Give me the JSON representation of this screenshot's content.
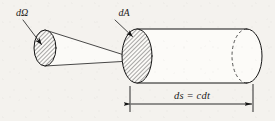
{
  "figure": {
    "kind": "physics-diagram",
    "background_color": "#f4f2ee",
    "ink_color": "#141414",
    "labels": {
      "solid_angle": "dΩ",
      "area_element": "dA",
      "path_length": "ds = cdt"
    },
    "elements": {
      "solid_angle_patch_name": "dΩ",
      "area_patch_name": "dA",
      "cylinder_name": "beam cylinder",
      "dimension_name": "ds = cdt"
    },
    "geometry": {
      "left_ellipse": {
        "cx": 45,
        "cy": 48,
        "rx": 11,
        "ry": 18,
        "hatched": true
      },
      "right_ellipse": {
        "cx": 137,
        "cy": 56,
        "rx": 15,
        "ry": 27,
        "hatched": true
      },
      "cylinder_far_cx": 247,
      "cylinder_far_ry": 27,
      "cone_apex_x": 140,
      "cone_apex_y": 60,
      "dimension_y": 104,
      "dimension_x_left": 130,
      "dimension_x_right": 253
    },
    "hatch": {
      "angle_deg": 45,
      "spacing_px": 3,
      "stroke_width": 0.7,
      "color": "#1b1b1b"
    }
  }
}
